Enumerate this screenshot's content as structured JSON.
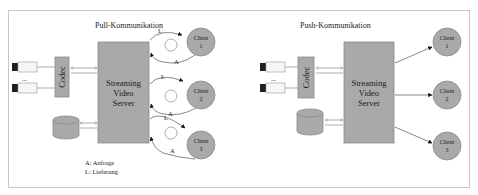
{
  "pull": {
    "title": "Pull-Kommunikation",
    "codec_label": "Codec",
    "server_lines": [
      "Streaming",
      "Video",
      "Server"
    ],
    "clients": [
      {
        "line1": "Client",
        "line2": "1"
      },
      {
        "line1": "Client",
        "line2": "2"
      },
      {
        "line1": "Client",
        "line2": "3"
      }
    ],
    "arc_labels": {
      "delivery": "L",
      "request": "A"
    },
    "ellipsis": "...",
    "legend": [
      "A: Anfrage",
      "L: Lieferung"
    ]
  },
  "push": {
    "title": "Push-Kommunikation",
    "codec_label": "Codec",
    "server_lines": [
      "Streaming",
      "Video",
      "Server"
    ],
    "clients": [
      {
        "line1": "Client",
        "line2": "1"
      },
      {
        "line1": "Client",
        "line2": "2"
      },
      {
        "line1": "Client",
        "line2": "3"
      }
    ],
    "ellipsis": "..."
  },
  "colors": {
    "box_fill": "#a9a9a9",
    "frame_stroke": "#c8c8c8"
  }
}
